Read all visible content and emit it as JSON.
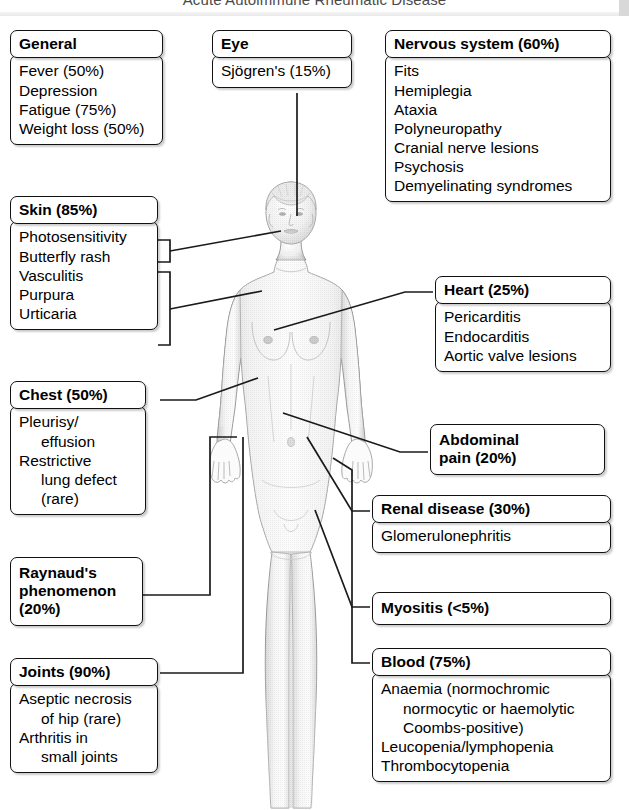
{
  "page": {
    "header_title": "Acute Autoimmune Rheumatic Disease"
  },
  "figure": {
    "alt_name": "female-anatomical-figure"
  },
  "boxes": {
    "general": {
      "title": "General",
      "items": [
        "Fever (50%)",
        "Depression",
        "Fatigue (75%)",
        "Weight loss (50%)"
      ]
    },
    "eye": {
      "title": "Eye",
      "items": [
        "Sjögren's (15%)"
      ]
    },
    "nervous": {
      "title": "Nervous system (60%)",
      "items": [
        "Fits",
        "Hemiplegia",
        "Ataxia",
        "Polyneuropathy",
        "Cranial nerve lesions",
        "Psychosis",
        "Demyelinating syndromes"
      ]
    },
    "skin": {
      "title": "Skin (85%)",
      "items": [
        "Photosensitivity",
        "Butterfly rash",
        "Vasculitis",
        "Purpura",
        "Urticaria"
      ]
    },
    "chest": {
      "title": "Chest (50%)",
      "lines": [
        {
          "text": "Pleurisy/",
          "indent": false
        },
        {
          "text": "effusion",
          "indent": true
        },
        {
          "text": "Restrictive",
          "indent": false
        },
        {
          "text": "lung defect",
          "indent": true
        },
        {
          "text": "(rare)",
          "indent": true
        }
      ]
    },
    "raynauds": {
      "title_lines": [
        "Raynaud's",
        "phenomenon",
        "(20%)"
      ]
    },
    "joints": {
      "title": "Joints (90%)",
      "lines": [
        {
          "text": "Aseptic necrosis",
          "indent": false
        },
        {
          "text": "of hip (rare)",
          "indent": true
        },
        {
          "text": "Arthritis in",
          "indent": false
        },
        {
          "text": "small joints",
          "indent": true
        }
      ]
    },
    "heart": {
      "title": "Heart (25%)",
      "items": [
        "Pericarditis",
        "Endocarditis",
        "Aortic valve lesions"
      ]
    },
    "abdominal": {
      "title_lines": [
        "Abdominal",
        "pain (20%)"
      ]
    },
    "renal": {
      "title": "Renal disease (30%)",
      "items": [
        "Glomerulonephritis"
      ]
    },
    "myositis": {
      "title_lines": [
        "Myositis (<5%)"
      ]
    },
    "blood": {
      "title": "Blood (75%)",
      "lines": [
        {
          "text": "Anaemia (normochromic",
          "indent": false
        },
        {
          "text": "normocytic or haemolytic",
          "indent": true
        },
        {
          "text": "Coombs-positive)",
          "indent": true
        },
        {
          "text": "Leucopenia/lymphopenia",
          "indent": false
        },
        {
          "text": "Thrombocytopenia",
          "indent": false
        }
      ]
    }
  },
  "colors": {
    "box_border": "#111111",
    "box_fill": "#ffffff",
    "connector": "#1a1a1a",
    "header_text": "#4a4a4a",
    "figure_tone": "#c9c9c9"
  }
}
